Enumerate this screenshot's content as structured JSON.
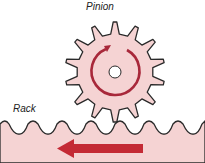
{
  "labels": {
    "pinion": "Pinion",
    "rack": "Rack"
  },
  "colors": {
    "fill": "#f5d3d3",
    "outline": "#2a2a2a",
    "arrow": "#b8232f",
    "rotation": "#a8283a"
  },
  "pinion": {
    "teeth": 14,
    "rotation": "clockwise"
  },
  "rack": {
    "motion": "left"
  }
}
